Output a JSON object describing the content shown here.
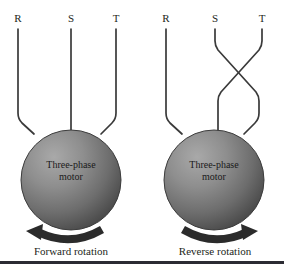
{
  "figure": {
    "background_color": "#ffffff",
    "wire_color": "#3a3a3a",
    "arrow_color": "#2b2b2b",
    "text_color": "#231f20",
    "rule_color": "#2b2b33",
    "motor_fill_light": "#9a9a9a",
    "motor_fill_dark": "#4c4c4c",
    "motor_edge": "#3d3d3d"
  },
  "panels": [
    {
      "id": "forward",
      "caption": "Forward rotation",
      "motor_label_line1": "Three-phase",
      "motor_label_line2": "motor",
      "rotation_direction": "counterclockwise",
      "arrow_head_side": "left",
      "phases": [
        {
          "label": "R",
          "terminal": "R",
          "crossed": false
        },
        {
          "label": "S",
          "terminal": "S",
          "crossed": false
        },
        {
          "label": "T",
          "terminal": "T",
          "crossed": false
        }
      ]
    },
    {
      "id": "reverse",
      "caption": "Reverse rotation",
      "motor_label_line1": "Three-phase",
      "motor_label_line2": "motor",
      "rotation_direction": "clockwise",
      "arrow_head_side": "right",
      "phases": [
        {
          "label": "R",
          "terminal": "R",
          "crossed": false
        },
        {
          "label": "S",
          "terminal": "T",
          "crossed": true
        },
        {
          "label": "T",
          "terminal": "S",
          "crossed": true
        }
      ]
    }
  ]
}
